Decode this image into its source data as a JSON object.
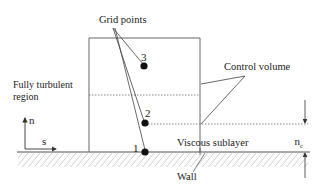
{
  "diagram": {
    "labels": {
      "grid_points": "Grid points",
      "control_volume": "Control volume",
      "fully_turbulent_1": "Fully turbulent",
      "fully_turbulent_2": "region",
      "viscous_sublayer": "Viscous sublayer",
      "wall": "Wall",
      "n_axis": "n",
      "s_axis": "s",
      "nc": "n",
      "nc_sub": "c"
    },
    "points": [
      {
        "id": "1",
        "label": "1"
      },
      {
        "id": "2",
        "label": "2"
      },
      {
        "id": "3",
        "label": "3"
      }
    ],
    "colors": {
      "line": "#555555",
      "point": "#111111",
      "text": "#222222"
    }
  }
}
